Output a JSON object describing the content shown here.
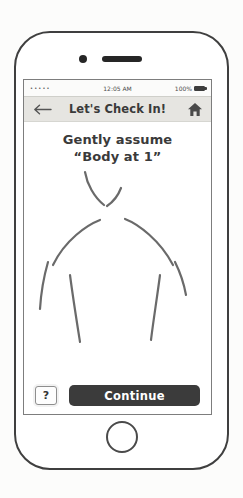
{
  "status_bar": {
    "carrier": "•••••",
    "time": "12:05 AM",
    "battery_percent": "100%"
  },
  "header": {
    "title": "Let's Check In!"
  },
  "icons": {
    "back": "left-arrow",
    "home": "house",
    "battery": "battery-full",
    "signal": "five-dots",
    "camera": "camera-dot",
    "speaker": "speaker-slot"
  },
  "content": {
    "instruction_line1": "Gently assume",
    "instruction_line2": "“Body at 1”"
  },
  "footer": {
    "help_label": "?",
    "continue_label": "Continue"
  },
  "colors": {
    "header_bg": "#e6e5e1",
    "continue_bg": "#3b3b3b",
    "continue_text": "#ffffff",
    "text": "#3a3a3a",
    "phone_outline": "#3f3f3f",
    "sketch_stroke": "#6a6a6a"
  }
}
